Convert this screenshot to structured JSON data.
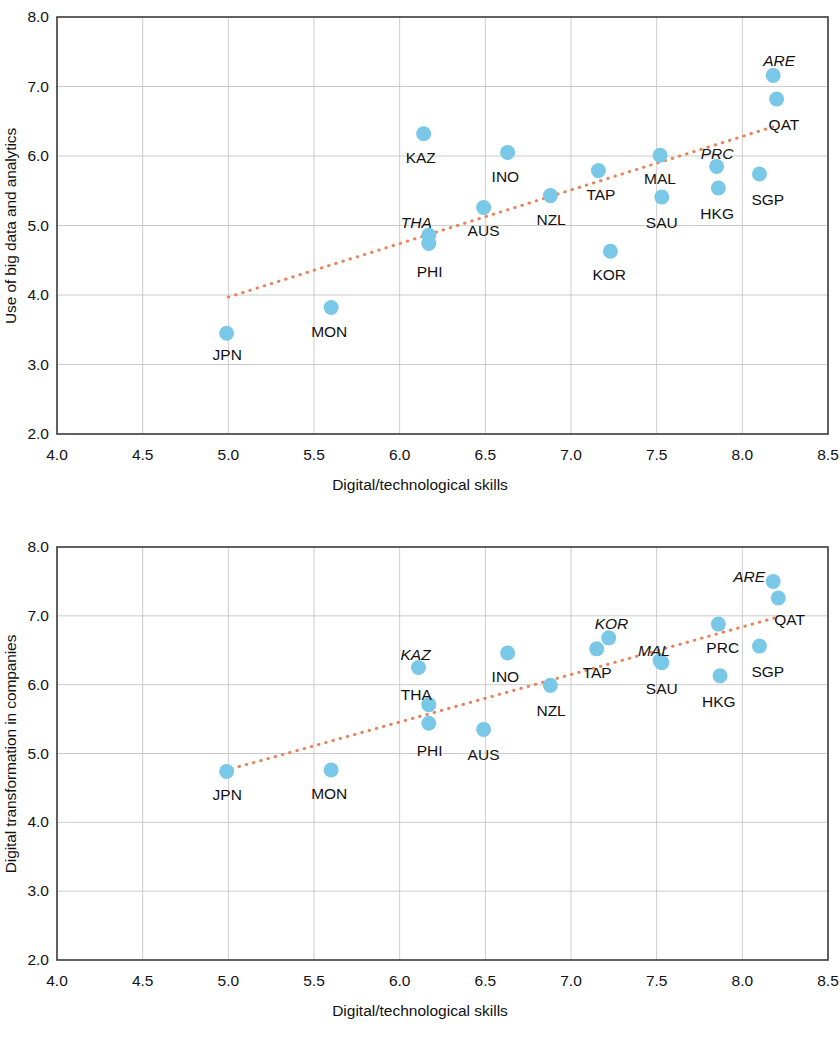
{
  "figure": {
    "series_color": "#79c8e8",
    "trend_color": "#e8835c",
    "axis_color": "#3a3a3a",
    "grid_color": "#bfbfbf"
  },
  "chart_data": [
    {
      "type": "scatter",
      "title": "",
      "xlabel": "Digital/technological skills",
      "ylabel": "Use of big data and analytics",
      "xlim": [
        4.0,
        8.5
      ],
      "ylim": [
        2.0,
        8.0
      ],
      "xticks": [
        "4.0",
        "4.5",
        "5.0",
        "5.5",
        "6.0",
        "6.5",
        "7.0",
        "7.5",
        "8.0",
        "8.5"
      ],
      "yticks": [
        "2.0",
        "3.0",
        "4.0",
        "5.0",
        "6.0",
        "7.0",
        "8.0"
      ],
      "grid": true,
      "legend": "none",
      "points": [
        {
          "label": "JPN",
          "x": 4.99,
          "y": 3.45,
          "italic": false,
          "lx": -14,
          "ly": 22
        },
        {
          "label": "MON",
          "x": 5.6,
          "y": 3.82,
          "italic": false,
          "lx": -20,
          "ly": 24
        },
        {
          "label": "KAZ",
          "x": 6.14,
          "y": 6.32,
          "italic": false,
          "lx": -18,
          "ly": 24
        },
        {
          "label": "THA",
          "x": 6.17,
          "y": 4.86,
          "italic": true,
          "lx": -28,
          "ly": -12
        },
        {
          "label": "PHI",
          "x": 6.17,
          "y": 4.74,
          "italic": false,
          "lx": -12,
          "ly": 28
        },
        {
          "label": "AUS",
          "x": 6.49,
          "y": 5.26,
          "italic": false,
          "lx": -16,
          "ly": 24
        },
        {
          "label": "INO",
          "x": 6.63,
          "y": 6.05,
          "italic": false,
          "lx": -16,
          "ly": 24
        },
        {
          "label": "NZL",
          "x": 6.88,
          "y": 5.43,
          "italic": false,
          "lx": -14,
          "ly": 24
        },
        {
          "label": "TAP",
          "x": 7.16,
          "y": 5.79,
          "italic": false,
          "lx": -12,
          "ly": 24
        },
        {
          "label": "KOR",
          "x": 7.23,
          "y": 4.63,
          "italic": false,
          "lx": -18,
          "ly": 24
        },
        {
          "label": "MAL",
          "x": 7.52,
          "y": 6.01,
          "italic": false,
          "lx": -16,
          "ly": 24
        },
        {
          "label": "SAU",
          "x": 7.53,
          "y": 5.41,
          "italic": false,
          "lx": -16,
          "ly": 26
        },
        {
          "label": "PRC",
          "x": 7.85,
          "y": 5.85,
          "italic": true,
          "lx": -16,
          "ly": -12
        },
        {
          "label": "HKG",
          "x": 7.86,
          "y": 5.54,
          "italic": false,
          "lx": -18,
          "ly": 26
        },
        {
          "label": "SGP",
          "x": 8.1,
          "y": 5.74,
          "italic": false,
          "lx": -8,
          "ly": 26
        },
        {
          "label": "ARE",
          "x": 8.18,
          "y": 7.16,
          "italic": true,
          "lx": -10,
          "ly": -14
        },
        {
          "label": "QAT",
          "x": 8.2,
          "y": 6.82,
          "italic": false,
          "lx": -8,
          "ly": 26
        }
      ],
      "trendline": {
        "x1": 5.0,
        "y1": 3.97,
        "x2": 8.18,
        "y2": 6.42
      }
    },
    {
      "type": "scatter",
      "title": "",
      "xlabel": "Digital/technological skills",
      "ylabel": "Digital transformation in companies",
      "xlim": [
        4.0,
        8.5
      ],
      "ylim": [
        2.0,
        8.0
      ],
      "xticks": [
        "4.0",
        "4.5",
        "5.0",
        "5.5",
        "6.0",
        "6.5",
        "7.0",
        "7.5",
        "8.0",
        "8.5"
      ],
      "yticks": [
        "2.0",
        "3.0",
        "4.0",
        "5.0",
        "6.0",
        "7.0",
        "8.0"
      ],
      "grid": true,
      "legend": "none",
      "points": [
        {
          "label": "JPN",
          "x": 4.99,
          "y": 4.74,
          "italic": false,
          "lx": -14,
          "ly": 24
        },
        {
          "label": "MON",
          "x": 5.6,
          "y": 4.76,
          "italic": false,
          "lx": -20,
          "ly": 24
        },
        {
          "label": "KAZ",
          "x": 6.11,
          "y": 6.25,
          "italic": true,
          "lx": -18,
          "ly": -12
        },
        {
          "label": "THA",
          "x": 6.17,
          "y": 5.71,
          "italic": false,
          "lx": -28,
          "ly": -10
        },
        {
          "label": "PHI",
          "x": 6.17,
          "y": 5.44,
          "italic": false,
          "lx": -12,
          "ly": 28
        },
        {
          "label": "AUS",
          "x": 6.49,
          "y": 5.35,
          "italic": false,
          "lx": -16,
          "ly": 26
        },
        {
          "label": "INO",
          "x": 6.63,
          "y": 6.46,
          "italic": false,
          "lx": -16,
          "ly": 24
        },
        {
          "label": "NZL",
          "x": 6.88,
          "y": 5.99,
          "italic": false,
          "lx": -14,
          "ly": 26
        },
        {
          "label": "TAP",
          "x": 7.15,
          "y": 6.52,
          "italic": false,
          "lx": -14,
          "ly": 24
        },
        {
          "label": "KOR",
          "x": 7.22,
          "y": 6.68,
          "italic": true,
          "lx": -14,
          "ly": -14
        },
        {
          "label": "MAL",
          "x": 7.52,
          "y": 6.35,
          "italic": true,
          "lx": -22,
          "ly": -10
        },
        {
          "label": "SAU",
          "x": 7.53,
          "y": 6.32,
          "italic": false,
          "lx": -16,
          "ly": 26
        },
        {
          "label": "PRC",
          "x": 7.86,
          "y": 6.88,
          "italic": false,
          "lx": -12,
          "ly": 24
        },
        {
          "label": "HKG",
          "x": 7.87,
          "y": 6.13,
          "italic": false,
          "lx": -18,
          "ly": 26
        },
        {
          "label": "SGP",
          "x": 8.1,
          "y": 6.56,
          "italic": false,
          "lx": -8,
          "ly": 26
        },
        {
          "label": "ARE",
          "x": 8.18,
          "y": 7.5,
          "italic": true,
          "lx": -40,
          "ly": -4
        },
        {
          "label": "QAT",
          "x": 8.21,
          "y": 7.26,
          "italic": false,
          "lx": -4,
          "ly": 22
        }
      ],
      "trendline": {
        "x1": 5.02,
        "y1": 4.78,
        "x2": 8.22,
        "y2": 6.99
      }
    }
  ]
}
